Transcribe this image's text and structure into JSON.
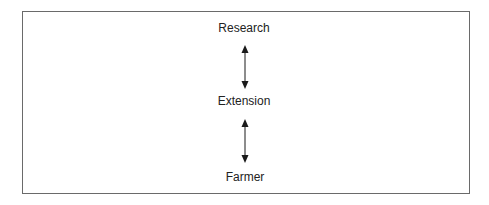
{
  "diagram": {
    "type": "vertical-flow",
    "nodes": [
      {
        "id": "research",
        "label": "Research"
      },
      {
        "id": "extension",
        "label": "Extension"
      },
      {
        "id": "farmer",
        "label": "Farmer"
      }
    ],
    "edges": [
      {
        "from": "research",
        "to": "extension",
        "direction": "bidirectional"
      },
      {
        "from": "extension",
        "to": "farmer",
        "direction": "bidirectional"
      }
    ],
    "colors": {
      "border": "#6a6a6a",
      "text": "#222222",
      "arrow": "#1a1a1a"
    }
  }
}
